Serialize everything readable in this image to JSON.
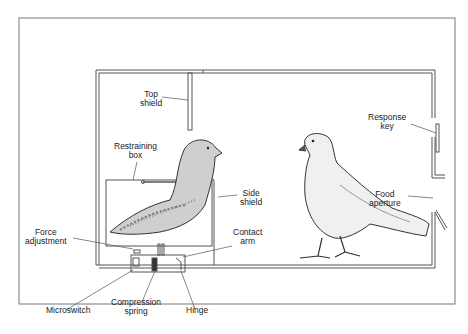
{
  "diagram": {
    "labels": {
      "top_shield": [
        "Top",
        "shield"
      ],
      "restraining_box": [
        "Restraining",
        "box"
      ],
      "side_shield": [
        "Side",
        "shield"
      ],
      "contact_arm": [
        "Contact",
        "arm"
      ],
      "force_adjustment": [
        "Force",
        "adjustment"
      ],
      "microswitch": [
        "Microswitch"
      ],
      "compression_spring": [
        "Compression",
        "spring"
      ],
      "hinge": [
        "Hinge"
      ],
      "response_key": [
        "Response",
        "key"
      ],
      "food_aperture": [
        "Food",
        "aperture"
      ]
    },
    "colors": {
      "line": "#555555",
      "text": "#222222",
      "background": "#ffffff"
    }
  }
}
